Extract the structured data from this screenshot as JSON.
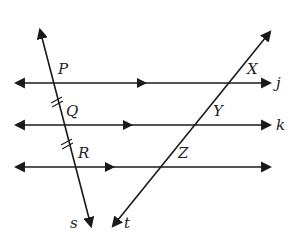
{
  "diagram": {
    "stroke_color": "#1a1a1a",
    "horizontal_lines": [
      {
        "name": "j",
        "y": 83,
        "x1": 16,
        "x2": 270,
        "mid_arrow_x": 142
      },
      {
        "name": "k",
        "y": 125,
        "x1": 16,
        "x2": 270,
        "mid_arrow_x": 128
      },
      {
        "name": "",
        "y": 167,
        "x1": 16,
        "x2": 270,
        "mid_arrow_x": 110
      }
    ],
    "transversals": [
      {
        "name": "s",
        "x1": 40,
        "y1": 30,
        "x2": 91,
        "y2": 226
      },
      {
        "name": "t",
        "x1": 270,
        "y1": 32,
        "x2": 113,
        "y2": 226
      }
    ],
    "points": [
      {
        "label": "P",
        "x": 58,
        "y": 62
      },
      {
        "label": "Q",
        "x": 66,
        "y": 104
      },
      {
        "label": "R",
        "x": 78,
        "y": 146
      },
      {
        "label": "X",
        "x": 247,
        "y": 62
      },
      {
        "label": "Y",
        "x": 213,
        "y": 104
      },
      {
        "label": "Z",
        "x": 178,
        "y": 146
      }
    ],
    "line_labels": [
      {
        "label": "j",
        "x": 276,
        "y": 76
      },
      {
        "label": "k",
        "x": 276,
        "y": 118
      },
      {
        "label": "s",
        "x": 70,
        "y": 216
      },
      {
        "label": "t",
        "x": 124,
        "y": 216
      }
    ],
    "congruence_marks": [
      {
        "segment": "PQ",
        "cx": 57,
        "cy": 102,
        "ticks": 2
      },
      {
        "segment": "QR",
        "cx": 67,
        "cy": 144,
        "ticks": 2
      }
    ]
  }
}
